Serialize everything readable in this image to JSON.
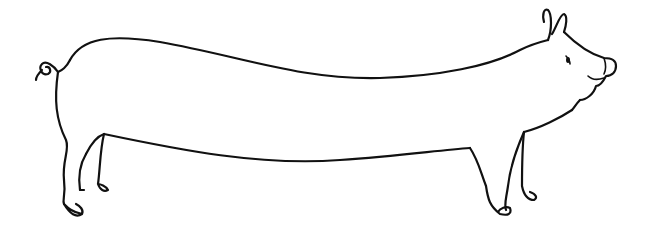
{
  "image": {
    "subject": "Line drawing of an elongated pig",
    "description": "Black outline sketch of a pig with an extremely long body, curly tail on the left, head with upright ears and smiling snout on the right, standing on four legs with hooves.",
    "background_color": "#ffffff",
    "line_color": "#111111",
    "parts": [
      "curly-tail",
      "back",
      "belly",
      "head",
      "ears",
      "eye",
      "snout",
      "mouth",
      "rear-legs",
      "front-legs",
      "hooves"
    ]
  }
}
